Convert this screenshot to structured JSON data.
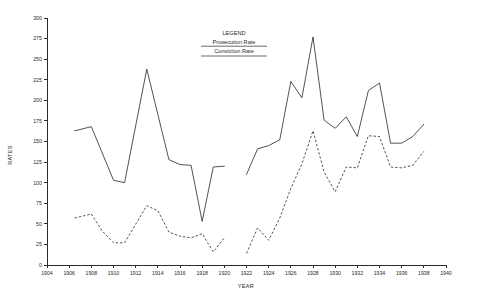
{
  "chart_data": {
    "type": "line",
    "title": "",
    "xlabel": "YEAR",
    "ylabel": "RATES",
    "xlim": [
      1904,
      1940
    ],
    "ylim": [
      0,
      300
    ],
    "xticks": [
      1904,
      1906,
      1908,
      1910,
      1912,
      1914,
      1916,
      1918,
      1920,
      1922,
      1924,
      1926,
      1928,
      1930,
      1932,
      1934,
      1936,
      1938,
      1940
    ],
    "yticks": [
      0,
      25,
      50,
      75,
      100,
      125,
      150,
      175,
      200,
      225,
      250,
      275,
      300
    ],
    "grid": false,
    "legend": {
      "title": "LEGEND",
      "position": "top-center",
      "entries": [
        {
          "label": "Prosecution Rate",
          "style": "solid"
        },
        {
          "label": "Conviction Rate",
          "style": "dashed"
        }
      ]
    },
    "series": [
      {
        "name": "Prosecution Rate",
        "style": "solid",
        "segments": [
          {
            "x": [
              1906.5,
              1908,
              1910,
              1911,
              1913,
              1914,
              1915,
              1916,
              1917,
              1918,
              1919,
              1920
            ],
            "y": [
              163,
              168,
              103,
              100,
              238,
              183,
              128,
              122,
              121,
              53,
              119,
              120
            ]
          },
          {
            "x": [
              1922,
              1923,
              1924,
              1925,
              1926,
              1927,
              1928,
              1929,
              1930,
              1931,
              1932,
              1933,
              1934,
              1935,
              1936,
              1937,
              1938
            ],
            "y": [
              110,
              141,
              145,
              152,
              223,
              203,
              277,
              176,
              166,
              180,
              156,
              212,
              221,
              148,
              148,
              156,
              171
            ]
          }
        ]
      },
      {
        "name": "Conviction Rate",
        "style": "dashed",
        "segments": [
          {
            "x": [
              1906.5,
              1908,
              1909,
              1910,
              1911,
              1913,
              1914,
              1915,
              1916,
              1917,
              1918,
              1919,
              1920
            ],
            "y": [
              57,
              62,
              41,
              27,
              27,
              72,
              66,
              40,
              35,
              33,
              38,
              16,
              33
            ]
          },
          {
            "x": [
              1922,
              1923,
              1924,
              1925,
              1926,
              1927,
              1928,
              1929,
              1930,
              1931,
              1932,
              1933,
              1934,
              1935,
              1936,
              1937,
              1938
            ],
            "y": [
              14,
              45,
              30,
              57,
              93,
              123,
              163,
              113,
              89,
              119,
              118,
              157,
              156,
              119,
              118,
              121,
              138
            ]
          }
        ]
      }
    ]
  },
  "axes": {
    "y_title": "RATES",
    "x_title": "YEAR",
    "y_tick_labels": [
      "0",
      "25",
      "50",
      "75",
      "100",
      "125",
      "150",
      "175",
      "200",
      "225",
      "250",
      "275",
      "300"
    ],
    "x_tick_labels": [
      "1904",
      "1906",
      "1908",
      "1910",
      "1912",
      "1914",
      "1916",
      "1918",
      "1920",
      "1922",
      "1924",
      "1926",
      "1928",
      "1930",
      "1932",
      "1934",
      "1936",
      "1938",
      "1940"
    ]
  },
  "legend": {
    "title": "LEGEND",
    "entry_1": "Prosecution Rate",
    "entry_2": "Conviction Rate"
  },
  "colors": {
    "ink": "#333333",
    "background": "#ffffff"
  }
}
